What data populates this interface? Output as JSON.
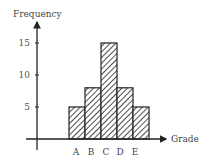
{
  "chart_data": {
    "type": "bar",
    "title": "",
    "xlabel": "Grade",
    "ylabel": "Frequency",
    "categories": [
      "A",
      "B",
      "C",
      "D",
      "E"
    ],
    "values": [
      5,
      8,
      15,
      8,
      5
    ],
    "yticks": [
      5,
      10,
      15
    ],
    "ylim": [
      0,
      18
    ],
    "grid": false,
    "legend": null,
    "style": {
      "bar_fill": "diagonal-hatch",
      "bar_edge_color": "#222222",
      "bar_gap": 0,
      "axis_color": "#222222"
    }
  }
}
